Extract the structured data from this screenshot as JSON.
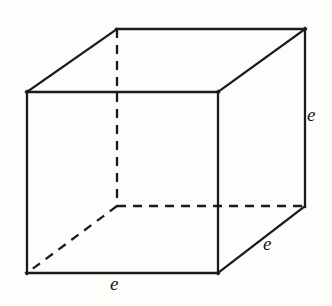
{
  "figure": {
    "name": "cube-diagram",
    "shape": "cube",
    "canvas": {
      "width": 332,
      "height": 306
    },
    "colors": {
      "background": "#fdfdfc",
      "stroke": "#1b1b1b",
      "label_text": "#161616"
    },
    "geometry": {
      "front_face": {
        "top_left": [
          27,
          92
        ],
        "top_right": [
          218,
          92
        ],
        "bottom_right": [
          218,
          273
        ],
        "bottom_left": [
          27,
          273
        ]
      },
      "back_face": {
        "top_left": [
          117,
          29
        ],
        "top_right": [
          305,
          29
        ],
        "bottom_right": [
          305,
          206
        ],
        "bottom_left": [
          117,
          206
        ]
      },
      "solid_edges": [
        [
          [
            27,
            92
          ],
          [
            218,
            92
          ]
        ],
        [
          [
            218,
            92
          ],
          [
            218,
            273
          ]
        ],
        [
          [
            218,
            273
          ],
          [
            27,
            273
          ]
        ],
        [
          [
            27,
            273
          ],
          [
            27,
            92
          ]
        ],
        [
          [
            27,
            92
          ],
          [
            117,
            29
          ]
        ],
        [
          [
            117,
            29
          ],
          [
            305,
            29
          ]
        ],
        [
          [
            305,
            29
          ],
          [
            218,
            92
          ]
        ],
        [
          [
            305,
            29
          ],
          [
            305,
            206
          ]
        ],
        [
          [
            305,
            206
          ],
          [
            218,
            273
          ]
        ]
      ],
      "hidden_edges": [
        [
          [
            117,
            29
          ],
          [
            117,
            206
          ]
        ],
        [
          [
            117,
            206
          ],
          [
            305,
            206
          ]
        ],
        [
          [
            117,
            206
          ],
          [
            27,
            273
          ]
        ]
      ],
      "dash_pattern": "9 7",
      "stroke_width": 2.3
    },
    "labels": [
      {
        "id": "edge-label-height",
        "text": "e",
        "edge": "right-vertical",
        "position": [
          307,
          105
        ],
        "meaning": "cube edge length (height)"
      },
      {
        "id": "edge-label-depth",
        "text": "e",
        "edge": "bottom-right-diagonal",
        "position": [
          263,
          234
        ],
        "meaning": "cube edge length (depth)"
      },
      {
        "id": "edge-label-width",
        "text": "e",
        "edge": "front-bottom",
        "position": [
          110,
          274
        ],
        "meaning": "cube edge length (width)"
      }
    ]
  }
}
